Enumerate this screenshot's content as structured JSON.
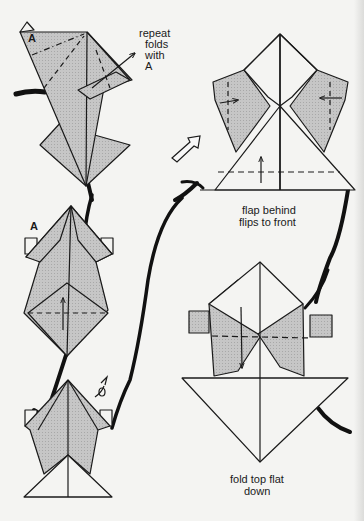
{
  "diagram": {
    "type": "origami-instructions",
    "colors": {
      "paper_background": "#f4f4f2",
      "folded_paper_shade": "#c4c4c4",
      "line": "#1a1a1a",
      "flow_path": "#111111"
    },
    "steps": [
      {
        "id": "step-1",
        "position": "top-left",
        "label_a": "A",
        "caption_lines": [
          "repeat",
          "folds",
          "with",
          "A"
        ],
        "symbols": [
          "dash-dot-fold-line",
          "dashed-fold-lines",
          "fold-arrow-up-right"
        ]
      },
      {
        "id": "step-2",
        "position": "middle-left",
        "label_a": "A",
        "symbols": [
          "dashed-fold-line",
          "fold-arrow-up"
        ]
      },
      {
        "id": "step-3",
        "position": "bottom-left",
        "symbols": [
          "turn-over-arrow"
        ]
      },
      {
        "id": "step-4",
        "position": "top-right",
        "caption_lines": [
          "flap behind",
          "flips to front"
        ],
        "symbols": [
          "hollow-push-arrow",
          "dashed-fold-lines",
          "fold-arrows-inward",
          "fold-arrow-up"
        ]
      },
      {
        "id": "step-5",
        "position": "bottom-right",
        "caption_lines": [
          "fold top flat",
          "down"
        ],
        "symbols": [
          "dashed-fold-line",
          "fold-arrow-down"
        ]
      }
    ]
  }
}
